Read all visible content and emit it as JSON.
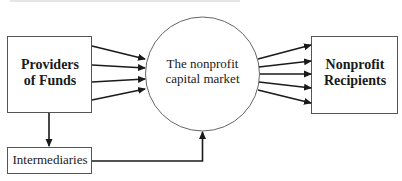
{
  "diagram": {
    "nodes": {
      "providers": {
        "label_line1": "Providers",
        "label_line2": "of Funds"
      },
      "market": {
        "label_line1": "The nonprofit",
        "label_line2": "capital market"
      },
      "recipients": {
        "label_line1": "Nonprofit",
        "label_line2": "Recipients"
      },
      "intermediaries": {
        "label": "Intermediaries"
      }
    },
    "edges": [
      {
        "from": "providers",
        "to": "market",
        "count": 4
      },
      {
        "from": "market",
        "to": "recipients",
        "count": 5
      },
      {
        "from": "providers",
        "to": "intermediaries",
        "count": 1
      },
      {
        "from": "intermediaries",
        "to": "market",
        "count": 1
      }
    ],
    "colors": {
      "stroke": "#1a1a1a",
      "box_border": "#555555",
      "circle_border": "#666666"
    }
  }
}
